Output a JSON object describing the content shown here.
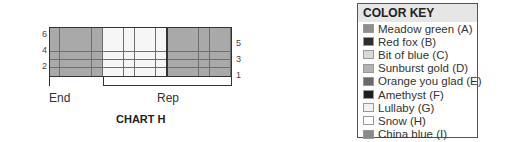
{
  "chart": {
    "title": "CHART H",
    "rows": 6,
    "columns": 17,
    "left_row_labels": [
      "6",
      "4",
      "2"
    ],
    "right_row_labels": [
      "5",
      "3",
      "1"
    ],
    "column_blocks": [
      {
        "start": 0,
        "count": 5,
        "color": "#a9a9a9",
        "key_letter": "A"
      },
      {
        "start": 5,
        "count": 6,
        "color": "#f6f6f6",
        "key_letter": "H"
      },
      {
        "start": 11,
        "count": 6,
        "color": "#a9a9a9",
        "key_letter": "A"
      }
    ],
    "thick_line_after_column": 10,
    "brackets": {
      "end_label": "End",
      "rep_label": "Rep",
      "end_columns": [
        0,
        5
      ],
      "rep_columns": [
        5,
        17
      ]
    }
  },
  "color_key": {
    "title": "COLOR KEY",
    "items": [
      {
        "label": "Meadow green (A)",
        "color": "#8e8e8e"
      },
      {
        "label": "Red fox (B)",
        "color": "#2e2e2e"
      },
      {
        "label": "Bit of blue (C)",
        "color": "#d9d9d9"
      },
      {
        "label": "Sunburst gold (D)",
        "color": "#b3b3b3"
      },
      {
        "label": "Orange you glad (E)",
        "color": "#6a6a6a"
      },
      {
        "label": "Amethyst (F)",
        "color": "#1e1e1e"
      },
      {
        "label": "Lullaby (G)",
        "color": "#f2f2f2"
      },
      {
        "label": "Snow (H)",
        "color": "#ffffff"
      },
      {
        "label": "China blue (I)",
        "color": "#8a8a8a"
      }
    ]
  }
}
